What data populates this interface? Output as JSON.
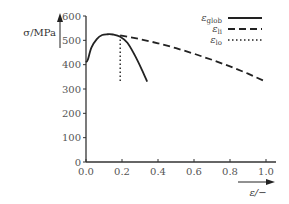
{
  "chart_data": {
    "type": "line",
    "title": "",
    "xlabel": "ε/−",
    "ylabel": "σ/MPa",
    "xlim": [
      0.0,
      1.0
    ],
    "ylim": [
      0,
      600
    ],
    "xticks": [
      "0.0",
      "0.2",
      "0.4",
      "0.6",
      "0.8",
      "1.0"
    ],
    "yticks": [
      "0",
      "100",
      "200",
      "300",
      "400",
      "500",
      "600"
    ],
    "grid": false,
    "legend_position": "top-right",
    "series": [
      {
        "name": "ε_glob",
        "label_main": "ε",
        "label_sub": "glob",
        "style": "solid",
        "x": [
          0.0,
          0.01,
          0.03,
          0.06,
          0.09,
          0.12,
          0.15,
          0.19,
          0.23,
          0.27,
          0.31,
          0.34
        ],
        "y": [
          410,
          420,
          470,
          505,
          522,
          525,
          524,
          515,
          490,
          440,
          380,
          330
        ]
      },
      {
        "name": "ε_li",
        "label_main": "ε",
        "label_sub": "li",
        "style": "dashed",
        "x": [
          0.19,
          0.3,
          0.4,
          0.5,
          0.6,
          0.7,
          0.8,
          0.9,
          1.0
        ],
        "y": [
          520,
          505,
          488,
          468,
          445,
          420,
          393,
          363,
          330
        ]
      },
      {
        "name": "ε_lo",
        "label_main": "ε",
        "label_sub": "lo",
        "style": "dotted",
        "x": [
          0.19,
          0.19
        ],
        "y": [
          520,
          330
        ]
      }
    ]
  },
  "axes": {
    "y_label": "σ/MPa",
    "x_label": "ε/−"
  },
  "colors": {
    "line": "#222222",
    "axis": "#333333",
    "text": "#555555"
  }
}
